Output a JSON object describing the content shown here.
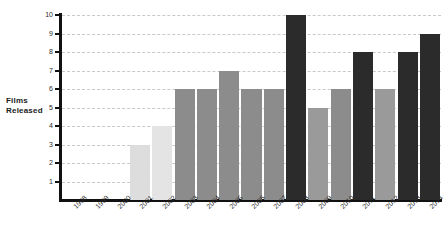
{
  "chart_data": {
    "type": "bar",
    "title": "",
    "subtitle": "",
    "xlabel": "",
    "ylabel": "Films Released",
    "ylabel_lines": [
      "Films",
      "Released"
    ],
    "categories": [
      "1998",
      "1999",
      "2000",
      "2001",
      "2002",
      "2003",
      "2004",
      "2005",
      "2006",
      "2007",
      "2008",
      "2009",
      "2010",
      "2011",
      "2012",
      "2013",
      "2014"
    ],
    "values": [
      0,
      0,
      0,
      3,
      4,
      6,
      6,
      7,
      6,
      6,
      10,
      5,
      6,
      8,
      6,
      8,
      9
    ],
    "bar_colors": [
      "#ffffff",
      "#ffffff",
      "#ffffff",
      "#dddddd",
      "#e4e4e4",
      "#8c8c8c",
      "#8c8c8c",
      "#8c8c8c",
      "#8c8c8c",
      "#8c8c8c",
      "#2b2b2b",
      "#9a9a9a",
      "#8c8c8c",
      "#2b2b2b",
      "#9a9a9a",
      "#2b2b2b",
      "#2b2b2b"
    ],
    "ylim": [
      0,
      10
    ],
    "yticks": [
      1,
      2,
      3,
      4,
      5,
      6,
      7,
      8,
      9,
      10
    ],
    "ytick_labels": [
      "1",
      "2",
      "3",
      "4",
      "5",
      "6",
      "7",
      "8",
      "9",
      "10"
    ],
    "grid": true,
    "grid_style": "dashed",
    "grid_color": "#c9c9c9",
    "legend": null,
    "legend_position": "none",
    "axis_color": "#111111",
    "background": "#ffffff"
  }
}
